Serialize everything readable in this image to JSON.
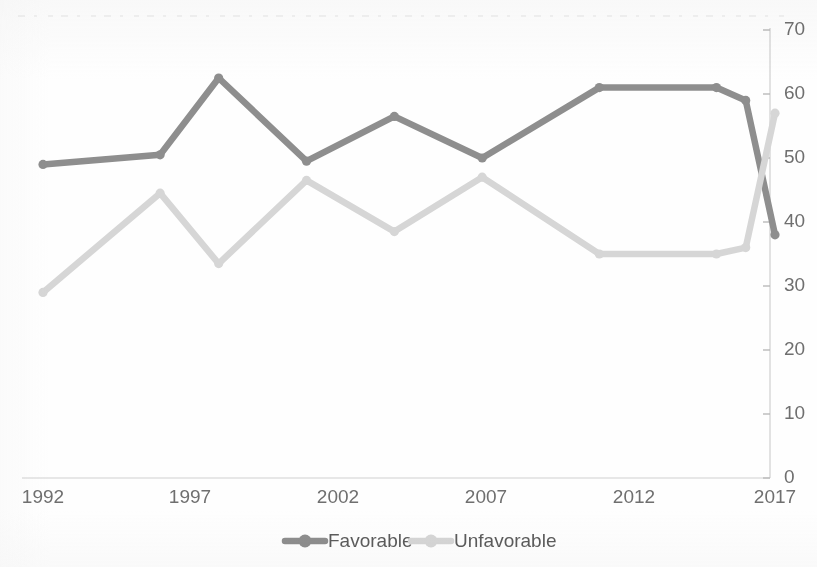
{
  "chart_data": {
    "type": "line",
    "title": "",
    "subtitle": "",
    "xlabel": "",
    "ylabel": "",
    "xlim": [
      1992,
      2017
    ],
    "ylim": [
      0,
      70
    ],
    "y_ticks": [
      0,
      10,
      20,
      30,
      40,
      50,
      60,
      70
    ],
    "x_ticks": [
      1992,
      1997,
      2002,
      2007,
      2012,
      2017
    ],
    "y_axis_position": "right",
    "grid": false,
    "legend_position": "bottom",
    "x": [
      1992,
      1996,
      1998,
      2001,
      2004,
      2007,
      2011,
      2015,
      2016,
      2017
    ],
    "series": [
      {
        "name": "Favorable",
        "color": "#8e8e8e",
        "values": [
          49,
          50.5,
          62.5,
          49.5,
          56.5,
          50,
          61,
          61,
          59,
          38
        ]
      },
      {
        "name": "Unfavorable",
        "color": "#d6d6d6",
        "values": [
          29,
          44.5,
          33.5,
          46.5,
          38.5,
          47,
          35,
          35,
          36,
          57
        ]
      }
    ]
  },
  "axes": {
    "y_tick_labels": [
      "70",
      "60",
      "50",
      "40",
      "30",
      "20",
      "10",
      "0"
    ],
    "x_tick_labels": [
      "1992",
      "1997",
      "2002",
      "2007",
      "2012",
      "2017"
    ]
  },
  "legend": {
    "items": [
      {
        "label": "Favorable",
        "color": "#8e8e8e"
      },
      {
        "label": "Unfavorable",
        "color": "#d6d6d6"
      }
    ]
  },
  "colors": {
    "favorable": "#8e8e8e",
    "unfavorable": "#d6d6d6",
    "axis": "#cfcfcf",
    "text": "#6f6f6f",
    "background": "#fefefe"
  }
}
